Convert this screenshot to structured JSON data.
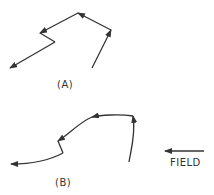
{
  "diagram": {
    "panel_a": {
      "label": "(A)",
      "path": "M92,68 L111,30 L78,13 L40,33 L55,42 L10,68",
      "arrows": [
        {
          "x": 111,
          "y": 30,
          "angle": -63
        },
        {
          "x": 80,
          "y": 14,
          "angle": 207
        },
        {
          "x": 41,
          "y": 33,
          "angle": 152
        },
        {
          "x": 11,
          "y": 67,
          "angle": 150
        }
      ]
    },
    "panel_b": {
      "label": "(B)",
      "path": "M129,162 C131,150 136,133 133,116 C120,114 100,115 92,117 C80,122 70,133 58,141 L63,153 C50,160 30,164 11,164",
      "arrows": [
        {
          "x": 134,
          "y": 118,
          "angle": -92
        },
        {
          "x": 93,
          "y": 117,
          "angle": 185
        },
        {
          "x": 59,
          "y": 140,
          "angle": 150
        },
        {
          "x": 12,
          "y": 164,
          "angle": 180
        }
      ]
    },
    "field": {
      "label": "FIELD",
      "direction": "left"
    },
    "colors": {
      "line": "#333333"
    }
  }
}
